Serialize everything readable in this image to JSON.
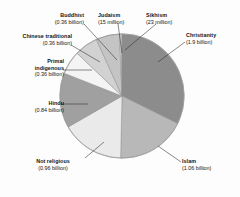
{
  "chart_data": {
    "type": "pie",
    "title": "",
    "subtitle": "",
    "xlabel": "",
    "ylabel": "",
    "legend_position": "none",
    "grid": false,
    "value_unit": "adherents",
    "categories": [
      "Christianity",
      "Islam",
      "Not religious",
      "Hindu",
      "Primal indigenous",
      "Chinese traditional",
      "Buddhist",
      "Sikhism",
      "Judaism"
    ],
    "values": [
      1.9,
      1.06,
      0.96,
      0.84,
      0.36,
      0.36,
      0.36,
      0.023,
      0.015
    ],
    "value_labels": [
      "(1.9 billion)",
      "(1.06 billion)",
      "(0.96 billion)",
      "(0.84 billion)",
      "(0.36 billion)",
      "(0.36 billion)",
      "(0.36 billion)",
      "(23 million)",
      "(15 million)"
    ],
    "colors": [
      "#8c8c8c",
      "#b8b8b8",
      "#eaeaea",
      "#a0a0a0",
      "#f4f4f4",
      "#d2d2d2",
      "#c4c4c4",
      "#efefef",
      "#dcdcdc"
    ]
  },
  "slices": [
    {
      "name": "Christianity",
      "value_label": "(1.9 billion)",
      "value": 1.9,
      "color": "#8c8c8c"
    },
    {
      "name": "Islam",
      "value_label": "(1.06 billion)",
      "value": 1.06,
      "color": "#b8b8b8"
    },
    {
      "name": "Not religious",
      "value_label": "(0.96 billion)",
      "value": 0.96,
      "color": "#eaeaea"
    },
    {
      "name": "Hindu",
      "value_label": "(0.84 billion)",
      "value": 0.84,
      "color": "#a0a0a0"
    },
    {
      "name": "Primal indigenous",
      "value_label": "(0.36 billion)",
      "value": 0.36,
      "color": "#f4f4f4"
    },
    {
      "name": "Chinese traditional",
      "value_label": "(0.36 billion)",
      "value": 0.36,
      "color": "#d2d2d2"
    },
    {
      "name": "Buddhist",
      "value_label": "(0.36 billion)",
      "value": 0.36,
      "color": "#c4c4c4"
    },
    {
      "name": "Sikhism",
      "value_label": "(23 million)",
      "value": 0.023,
      "color": "#efefef"
    },
    {
      "name": "Judaism",
      "value_label": "(15 million)",
      "value": 0.015,
      "color": "#dcdcdc"
    }
  ],
  "labels": {
    "buddhist": {
      "name": "Buddhist",
      "value": "(0.36 billion)"
    },
    "judaism": {
      "name": "Judaism",
      "value": "(15 million)"
    },
    "sikhism": {
      "name": "Sikhism",
      "value": "(23 million)"
    },
    "christianity": {
      "name": "Christianity",
      "value": "(1.9 billion)"
    },
    "chinese": {
      "name": "Chinese traditional",
      "value": "(0.36 billion)"
    },
    "primal": {
      "name_line1": "Primal",
      "name_line2": "indigenous",
      "value": "(0.36 billion)"
    },
    "hindu": {
      "name": "Hindu",
      "value": "(0.84 billion)"
    },
    "notreligious": {
      "name": "Not religious",
      "value": "(0.96 billion)"
    },
    "islam": {
      "name": "Islam",
      "value": "(1.06 billion)"
    }
  }
}
